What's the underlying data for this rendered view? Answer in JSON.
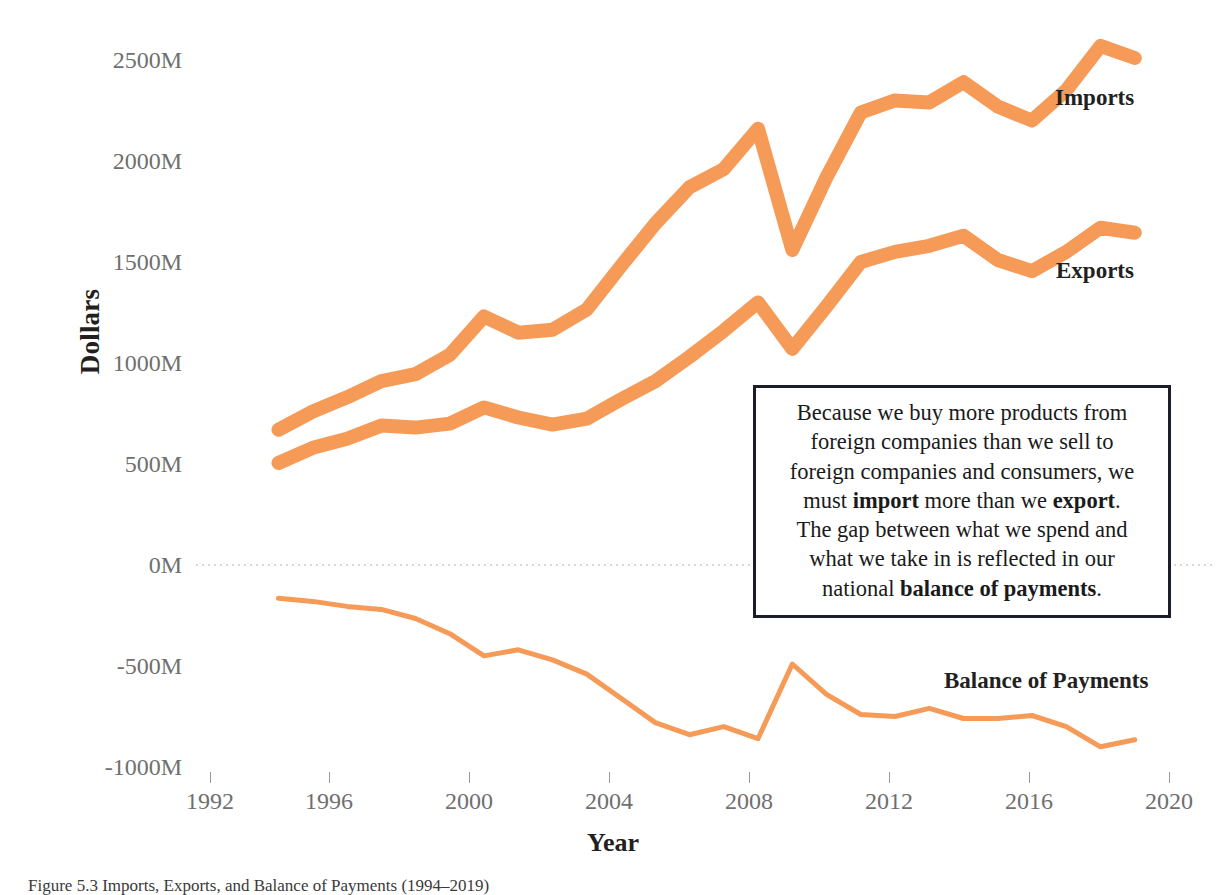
{
  "figure": {
    "caption": "Figure 5.3 Imports, Exports, and Balance of Payments (1994–2019)"
  },
  "axes": {
    "y_title": "Dollars",
    "x_title": "Year",
    "y_ticks": [
      "2500M",
      "2000M",
      "1500M",
      "1000M",
      "500M",
      "0M",
      "-500M",
      "-1000M"
    ],
    "x_ticks": [
      "1992",
      "1996",
      "2000",
      "2004",
      "2008",
      "2012",
      "2016",
      "2020"
    ]
  },
  "series_labels": {
    "imports": "Imports",
    "exports": "Exports",
    "balance": "Balance of Payments"
  },
  "annotation": {
    "line1": "Because we buy more products from",
    "line2": "foreign companies than we sell to",
    "line3": "foreign companies and consumers, we",
    "line4_pre": "must ",
    "line4_b1": "import",
    "line4_mid": " more than we ",
    "line4_b2": "export",
    "line4_post": ".",
    "line5": "The gap between what we spend and",
    "line6": "what we take in is reflected in our",
    "line7_pre": "national ",
    "line7_b": "balance of payments",
    "line7_post": "."
  },
  "colors": {
    "series_orange": "#F69A57",
    "axis_text": "#6F6F6F",
    "title_text": "#231F20",
    "annotation_border": "#1B1D2B",
    "gridline": "#D8D8D8",
    "background": "#FFFFFF"
  },
  "chart_data": {
    "type": "line",
    "xlabel": "Year",
    "ylabel": "Dollars",
    "xlim": [
      1992,
      2020
    ],
    "ylim": [
      -1000,
      2750
    ],
    "y_unit": "Millions of dollars",
    "grid": "horizontal dotted gridline at 0M only",
    "legend": "direct labels at right end of each series",
    "x": [
      1994,
      1995,
      1996,
      1997,
      1998,
      1999,
      2000,
      2001,
      2002,
      2003,
      2004,
      2005,
      2006,
      2007,
      2008,
      2009,
      2010,
      2011,
      2012,
      2013,
      2014,
      2015,
      2016,
      2017,
      2018,
      2019
    ],
    "series": [
      {
        "name": "Imports",
        "color": "#F69A57",
        "values": [
          670,
          760,
          830,
          910,
          945,
          1040,
          1230,
          1150,
          1165,
          1265,
          1480,
          1690,
          1870,
          1960,
          2160,
          1560,
          1920,
          2240,
          2300,
          2290,
          2390,
          2270,
          2200,
          2350,
          2570,
          2510
        ]
      },
      {
        "name": "Exports",
        "color": "#F69A57",
        "values": [
          505,
          580,
          625,
          690,
          680,
          700,
          780,
          730,
          695,
          725,
          820,
          910,
          1030,
          1160,
          1300,
          1070,
          1280,
          1500,
          1550,
          1580,
          1630,
          1510,
          1455,
          1550,
          1670,
          1645
        ]
      },
      {
        "name": "Balance of Payments",
        "color": "#F69A57",
        "values": [
          -165,
          -180,
          -205,
          -220,
          -265,
          -340,
          -450,
          -420,
          -470,
          -540,
          -660,
          -780,
          -840,
          -800,
          -860,
          -490,
          -640,
          -740,
          -750,
          -710,
          -760,
          -760,
          -745,
          -800,
          -900,
          -865
        ]
      }
    ]
  }
}
